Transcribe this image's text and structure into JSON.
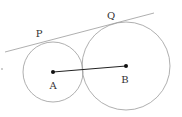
{
  "diagram": {
    "type": "geometry",
    "colors": {
      "stroke": "#9a9a9a",
      "segment": "#222222",
      "point": "#111111",
      "text": "#333333"
    },
    "circles": [
      {
        "id": "A",
        "cx": 53,
        "cy": 72,
        "r": 30
      },
      {
        "id": "B",
        "cx": 126,
        "cy": 66,
        "r": 44
      }
    ],
    "tangent_line": {
      "x1": 5,
      "y1": 52,
      "x2": 154,
      "y2": 13
    },
    "segment_AB": {
      "x1": 53,
      "y1": 72,
      "x2": 126,
      "y2": 66
    },
    "points": [
      {
        "id": "A",
        "x": 53,
        "y": 72
      },
      {
        "id": "B",
        "x": 126,
        "y": 66
      },
      {
        "id": "stray",
        "x": 2,
        "y": 69
      }
    ],
    "labels": {
      "P": "P",
      "Q": "Q",
      "A": "A",
      "B": "B"
    }
  }
}
